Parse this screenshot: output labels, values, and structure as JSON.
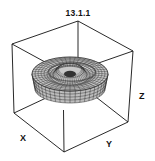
{
  "figure": {
    "title": "13.1.1",
    "axis_labels": {
      "x": "X",
      "y": "Y",
      "z": "Z"
    },
    "colors": {
      "line": "#111111",
      "mesh_fill": "#bdbdbd",
      "mesh_line": "#2a2a2a",
      "hole": "#333333",
      "background": "#ffffff"
    },
    "box": {
      "top_back": [
        78,
        21
      ],
      "top_left": [
        12,
        44
      ],
      "top_right": [
        133,
        51
      ],
      "bottom_left": [
        14,
        113
      ],
      "bottom_front": [
        64,
        152
      ],
      "bottom_right": [
        128,
        122
      ]
    },
    "surface": {
      "center": [
        70,
        80
      ],
      "outer_rx": 38,
      "outer_ry": 17,
      "depth": 15,
      "inner_rx": 11,
      "inner_ry": 6,
      "hole_center": [
        70,
        74
      ],
      "ring_count": 9,
      "sector_count": 44
    }
  }
}
